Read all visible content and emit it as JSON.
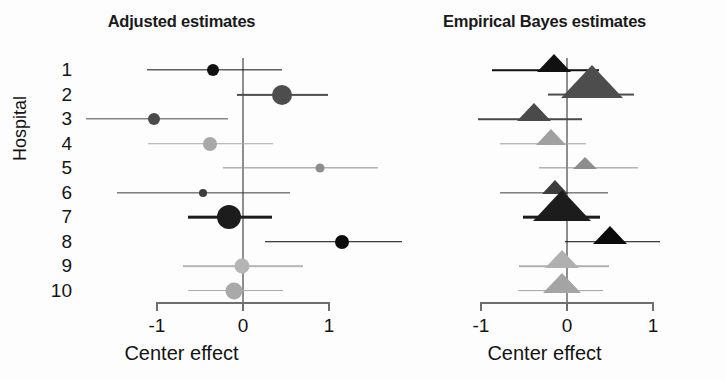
{
  "figure": {
    "width": 726,
    "height": 380,
    "background": "#fdfdfd",
    "ylabel": "Hospital",
    "categories": [
      "1",
      "2",
      "3",
      "4",
      "5",
      "6",
      "7",
      "8",
      "9",
      "10"
    ],
    "x_ticks": [
      "-1",
      "0",
      "1"
    ],
    "x_tick_values": [
      -1,
      0,
      1
    ],
    "xlabel": "Center effect",
    "xlim": [
      -1.3,
      1.55
    ]
  },
  "chart_data": [
    {
      "type": "scatter",
      "title": "Adjusted estimates",
      "panel": "left",
      "marker": "circle",
      "xlabel": "Center effect",
      "ylabel": "Hospital",
      "categories": [
        "1",
        "2",
        "3",
        "4",
        "5",
        "6",
        "7",
        "8",
        "9",
        "10"
      ],
      "xlim": [
        -1.3,
        1.55
      ],
      "xticks": [
        -1,
        0,
        1
      ],
      "grid": false,
      "legend": "none",
      "reference_line": 0,
      "points": [
        {
          "hospital": "1",
          "estimate": -0.35,
          "ci_low": -1.12,
          "ci_high": 0.45,
          "size": 12,
          "color": "#111111"
        },
        {
          "hospital": "2",
          "estimate": 0.45,
          "ci_low": -0.07,
          "ci_high": 0.99,
          "size": 20,
          "color": "#4d4d4d"
        },
        {
          "hospital": "3",
          "estimate": -1.03,
          "ci_low": -1.82,
          "ci_high": -0.17,
          "size": 12,
          "color": "#4a4a4a"
        },
        {
          "hospital": "4",
          "estimate": -0.38,
          "ci_low": -1.1,
          "ci_high": 0.35,
          "size": 14,
          "color": "#a8a8a8"
        },
        {
          "hospital": "5",
          "estimate": 0.9,
          "ci_low": -0.23,
          "ci_high": 1.57,
          "size": 9,
          "color": "#8d8d8d"
        },
        {
          "hospital": "6",
          "estimate": -0.46,
          "ci_low": -1.47,
          "ci_high": 0.55,
          "size": 8,
          "color": "#3c3c3c"
        },
        {
          "hospital": "7",
          "estimate": -0.16,
          "ci_low": -0.64,
          "ci_high": 0.34,
          "size": 24,
          "color": "#1c1c1c"
        },
        {
          "hospital": "8",
          "estimate": 1.15,
          "ci_low": 0.25,
          "ci_high": 1.85,
          "size": 14,
          "color": "#0b0b0b"
        },
        {
          "hospital": "9",
          "estimate": -0.01,
          "ci_low": -0.7,
          "ci_high": 0.7,
          "size": 15,
          "color": "#b5b5b5"
        },
        {
          "hospital": "10",
          "estimate": -0.1,
          "ci_low": -0.64,
          "ci_high": 0.47,
          "size": 17,
          "color": "#a9a9a9"
        }
      ]
    },
    {
      "type": "scatter",
      "title": "Empirical Bayes estimates",
      "panel": "right",
      "marker": "triangle",
      "xlabel": "Center effect",
      "ylabel": "Hospital",
      "categories": [
        "1",
        "2",
        "3",
        "4",
        "5",
        "6",
        "7",
        "8",
        "9",
        "10"
      ],
      "xlim": [
        -1.3,
        1.55
      ],
      "xticks": [
        -1,
        0,
        1
      ],
      "grid": false,
      "legend": "none",
      "reference_line": 0,
      "points": [
        {
          "hospital": "1",
          "estimate": -0.15,
          "ci_low": -0.87,
          "ci_high": 0.37,
          "size": 14,
          "color": "#111111"
        },
        {
          "hospital": "2",
          "estimate": 0.3,
          "ci_low": -0.22,
          "ci_high": 0.78,
          "size": 26,
          "color": "#4d4d4d"
        },
        {
          "hospital": "3",
          "estimate": -0.38,
          "ci_low": -1.03,
          "ci_high": 0.17,
          "size": 14,
          "color": "#4a4a4a"
        },
        {
          "hospital": "4",
          "estimate": -0.18,
          "ci_low": -0.78,
          "ci_high": 0.22,
          "size": 13,
          "color": "#a0a0a0"
        },
        {
          "hospital": "5",
          "estimate": 0.21,
          "ci_low": -0.33,
          "ci_high": 0.83,
          "size": 10,
          "color": "#8d8d8d"
        },
        {
          "hospital": "6",
          "estimate": -0.13,
          "ci_low": -0.78,
          "ci_high": 0.48,
          "size": 11,
          "color": "#3c3c3c"
        },
        {
          "hospital": "7",
          "estimate": -0.05,
          "ci_low": -0.51,
          "ci_high": 0.38,
          "size": 24,
          "color": "#1c1c1c"
        },
        {
          "hospital": "8",
          "estimate": 0.5,
          "ci_low": -0.02,
          "ci_high": 1.08,
          "size": 14,
          "color": "#0b0b0b"
        },
        {
          "hospital": "9",
          "estimate": -0.06,
          "ci_low": -0.56,
          "ci_high": 0.49,
          "size": 14,
          "color": "#b0b0b0"
        },
        {
          "hospital": "10",
          "estimate": -0.05,
          "ci_low": -0.57,
          "ci_high": 0.42,
          "size": 16,
          "color": "#a4a4a4"
        }
      ]
    }
  ]
}
